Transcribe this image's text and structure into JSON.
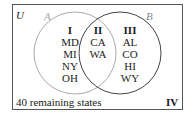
{
  "universe_label": "U",
  "set_a_label": "A",
  "set_b_label": "B",
  "regions": {
    "I": {
      "label": "I",
      "items": [
        "MD",
        "MI",
        "NY",
        "OH"
      ]
    },
    "II": {
      "label": "II",
      "items": [
        "CA",
        "WA"
      ]
    },
    "III": {
      "label": "III",
      "items": [
        "AL",
        "CO",
        "HI",
        "WY"
      ]
    },
    "IV": {
      "label": "IV",
      "text": "40 remaining states"
    }
  },
  "colors": {
    "frame": "#555555",
    "circle_a": "#aaaaaa",
    "circle_b": "#444444",
    "text": "#222222"
  }
}
